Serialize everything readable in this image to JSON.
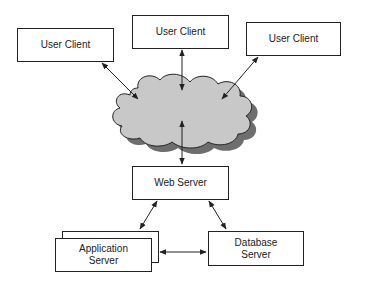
{
  "diagram": {
    "colors": {
      "line": "#222222",
      "cloud_fill": "#c8c8c8",
      "cloud_shadow": "#6e6e6e",
      "box_fill": "#ffffff"
    },
    "nodes": {
      "client_left": {
        "label": "User Client"
      },
      "client_center": {
        "label": "User Client"
      },
      "client_right": {
        "label": "User Client"
      },
      "cloud": {
        "label": ""
      },
      "web_server": {
        "label": "Web Server"
      },
      "app_server": {
        "line1": "Application",
        "line2": "Server"
      },
      "db_server": {
        "line1": "Database",
        "line2": "Server"
      }
    },
    "edges": [
      {
        "from": "client_left",
        "to": "cloud",
        "bidirectional": true
      },
      {
        "from": "client_center",
        "to": "cloud",
        "bidirectional": true
      },
      {
        "from": "client_right",
        "to": "cloud",
        "bidirectional": true
      },
      {
        "from": "cloud",
        "to": "web_server",
        "bidirectional": true
      },
      {
        "from": "web_server",
        "to": "app_server",
        "bidirectional": true
      },
      {
        "from": "web_server",
        "to": "db_server",
        "bidirectional": true
      },
      {
        "from": "app_server",
        "to": "db_server",
        "bidirectional": true
      }
    ]
  }
}
